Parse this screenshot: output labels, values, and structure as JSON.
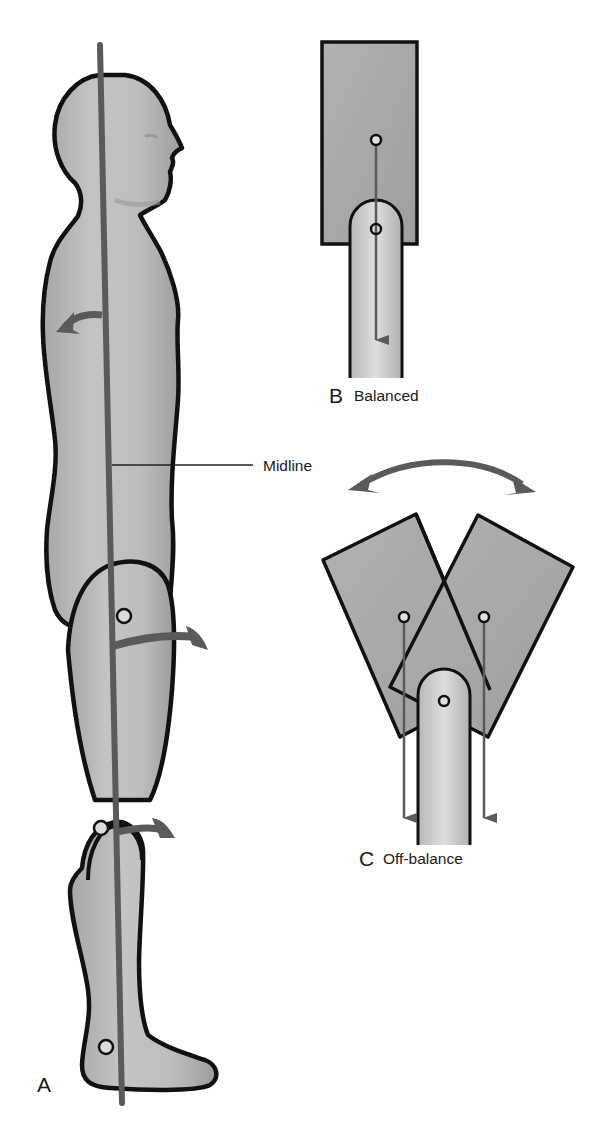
{
  "figure": {
    "panels": [
      {
        "id": "A",
        "letter": "A",
        "caption": "",
        "subject": "standing human figure, side view"
      },
      {
        "id": "B",
        "letter": "B",
        "caption": "Balanced",
        "subject": "block centered on peg"
      },
      {
        "id": "C",
        "letter": "C",
        "caption": "Off-balance",
        "subject": "block tilting left and right on peg"
      }
    ],
    "annotations": {
      "midline": "Midline"
    },
    "icons": {
      "gravity_arrow": "arrow-down-icon",
      "rotation_arrow": "curved-arrow-icon",
      "swing_arrow": "double-curved-arrow-icon",
      "joint_marker": "circle-icon"
    },
    "colors": {
      "outline": "#111111",
      "body_fill": "#b4b4b4",
      "body_highlight": "#d6d6d6",
      "block_fill": "#a8a8a8",
      "peg_fill": "#cfcfcf",
      "arrow": "#5a5a5a",
      "joint_fill": "#dcdcdc",
      "background": "#ffffff"
    }
  }
}
